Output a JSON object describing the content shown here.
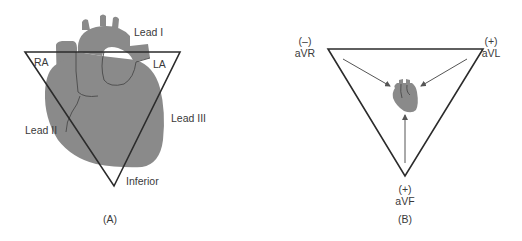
{
  "figure": {
    "panel_a": {
      "caption": "(A)",
      "title_label": "Lead I",
      "vertex_labels": {
        "right_arm": "RA",
        "left_arm": "LA",
        "inferior": "Inferior"
      },
      "side_labels": {
        "lead_ii": "Lead II",
        "lead_iii": "Lead III"
      }
    },
    "panel_b": {
      "caption": "(B)",
      "leads": [
        {
          "name": "aVR",
          "polarity": "(–)"
        },
        {
          "name": "aVL",
          "polarity": "(+)"
        },
        {
          "name": "aVF",
          "polarity": "(+)"
        }
      ]
    }
  },
  "colors": {
    "heart": "#8a8a8a",
    "triangle": "#2b2b2b",
    "text": "#3a3a3a"
  }
}
